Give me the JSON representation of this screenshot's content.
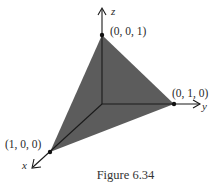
{
  "figure": {
    "caption": "Figure 6.34",
    "fill_color": "#5a5a5a",
    "line_color": "#1a1a1a",
    "axes": {
      "x": {
        "label": "x"
      },
      "y": {
        "label": "y"
      },
      "z": {
        "label": "z"
      }
    },
    "vertices": [
      {
        "name": "z-vertex",
        "label": "(0, 0, 1)"
      },
      {
        "name": "y-vertex",
        "label": "(0, 1, 0)"
      },
      {
        "name": "x-vertex",
        "label": "(1, 0, 0)"
      }
    ]
  }
}
